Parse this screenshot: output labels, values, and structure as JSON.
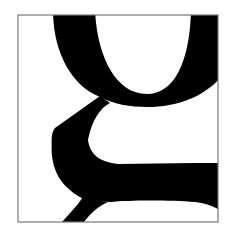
{
  "figure": {
    "letter": "g",
    "colors": {
      "background": "#ffffff",
      "glyph": "#000000",
      "frame": "#777777"
    },
    "frame": {
      "x": 18,
      "y": 15,
      "width": 200,
      "height": 207
    }
  }
}
